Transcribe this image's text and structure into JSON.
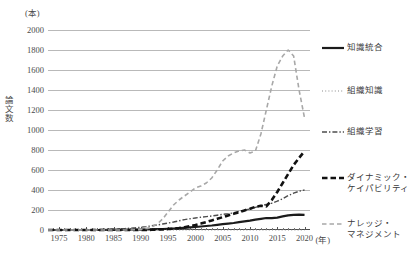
{
  "chart_data": {
    "type": "line",
    "title": "",
    "xlabel": "(年)",
    "ylabel": "論文数",
    "unit_label": "(本)",
    "xlim": [
      1973,
      2021
    ],
    "ylim": [
      0,
      2000
    ],
    "y_ticks": [
      0,
      200,
      400,
      600,
      800,
      1000,
      1200,
      1400,
      1600,
      1800,
      2000
    ],
    "x_ticks": [
      1975,
      1980,
      1985,
      1990,
      1995,
      2000,
      2005,
      2010,
      2015,
      2020
    ],
    "x_tick_labels": [
      "1975",
      "1980",
      "1985",
      "1990",
      "1995",
      "2000",
      "2005",
      "2010",
      "2015",
      "2020"
    ],
    "grid": true,
    "legend_position": "right",
    "x": [
      1973,
      1974,
      1975,
      1976,
      1977,
      1978,
      1979,
      1980,
      1981,
      1982,
      1983,
      1984,
      1985,
      1986,
      1987,
      1988,
      1989,
      1990,
      1991,
      1992,
      1993,
      1994,
      1995,
      1996,
      1997,
      1998,
      1999,
      2000,
      2001,
      2002,
      2003,
      2004,
      2005,
      2006,
      2007,
      2008,
      2009,
      2010,
      2011,
      2012,
      2013,
      2014,
      2015,
      2016,
      2017,
      2018,
      2019,
      2020
    ],
    "series": [
      {
        "name": "知識統合",
        "style": "solid",
        "color": "#1b1b1b",
        "width": 2.2,
        "values": [
          0,
          0,
          0,
          0,
          0,
          0,
          0,
          0,
          0,
          0,
          0,
          1,
          1,
          1,
          2,
          2,
          3,
          4,
          5,
          6,
          8,
          10,
          12,
          15,
          18,
          22,
          26,
          30,
          35,
          40,
          45,
          52,
          58,
          64,
          70,
          78,
          86,
          94,
          104,
          112,
          120,
          118,
          124,
          136,
          146,
          152,
          154,
          152
        ]
      },
      {
        "name": "組織知識",
        "style": "dotted",
        "color": "#8c8c8c",
        "width": 1.1,
        "values": [
          0,
          0,
          0,
          0,
          0,
          0,
          0,
          0,
          0,
          0,
          0,
          0,
          0,
          0,
          0,
          0,
          0,
          0,
          0,
          0,
          0,
          0,
          0,
          0,
          0,
          0,
          0,
          0,
          0,
          0,
          0,
          0,
          0,
          0,
          0,
          0,
          0,
          0,
          0,
          0,
          0,
          0,
          0,
          0,
          0,
          0,
          0,
          0
        ]
      },
      {
        "name": "組織学習",
        "style": "dashdot",
        "color": "#4d4d4d",
        "width": 1.4,
        "values": [
          0,
          0,
          0,
          1,
          1,
          2,
          2,
          3,
          4,
          5,
          6,
          8,
          10,
          12,
          14,
          18,
          22,
          28,
          34,
          42,
          50,
          60,
          70,
          80,
          92,
          104,
          112,
          120,
          128,
          134,
          140,
          148,
          156,
          162,
          172,
          186,
          198,
          210,
          226,
          242,
          256,
          268,
          288,
          312,
          344,
          368,
          388,
          400
        ]
      },
      {
        "name": "ダイナミック・\nケイパビリティ",
        "style": "dashed-thick",
        "color": "#111111",
        "width": 2.6,
        "values": [
          0,
          0,
          0,
          0,
          0,
          0,
          0,
          0,
          0,
          0,
          0,
          0,
          0,
          0,
          0,
          0,
          0,
          0,
          0,
          2,
          4,
          6,
          10,
          14,
          20,
          28,
          38,
          50,
          64,
          80,
          96,
          112,
          128,
          146,
          162,
          178,
          196,
          212,
          232,
          242,
          236,
          300,
          380,
          470,
          560,
          650,
          720,
          790
        ]
      },
      {
        "name": "ナレッジ・\nマネジメント",
        "style": "dashed-thin",
        "color": "#a8a8a8",
        "width": 1.6,
        "values": [
          0,
          0,
          0,
          0,
          0,
          0,
          0,
          0,
          0,
          0,
          0,
          0,
          0,
          0,
          0,
          0,
          2,
          6,
          14,
          30,
          60,
          110,
          180,
          250,
          300,
          340,
          380,
          420,
          440,
          470,
          520,
          600,
          690,
          740,
          770,
          790,
          800,
          770,
          790,
          960,
          1200,
          1440,
          1640,
          1740,
          1800,
          1740,
          1400,
          1120
        ]
      }
    ]
  },
  "legend": {
    "items": [
      {
        "label": "知識統合",
        "style": "solid"
      },
      {
        "label": "組織知識",
        "style": "dotted"
      },
      {
        "label": "組織学習",
        "style": "dashdot"
      },
      {
        "label": "ダイナミック・\nケイパビリティ",
        "style": "dashed-thick"
      },
      {
        "label": "ナレッジ・\nマネジメント",
        "style": "dashed-thin"
      }
    ]
  }
}
